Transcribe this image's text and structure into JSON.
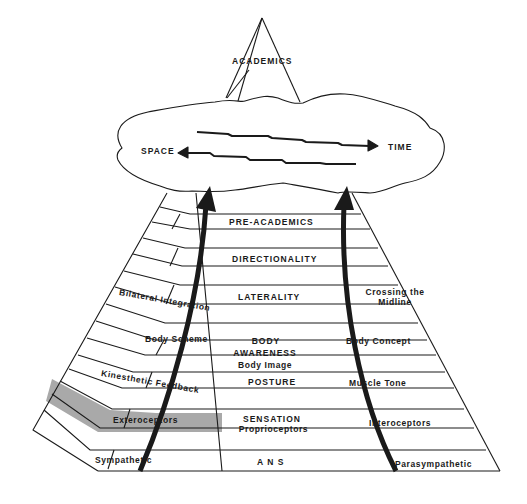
{
  "apex": {
    "label": "ACADEMICS"
  },
  "cloud": {
    "left_label": "SPACE",
    "right_label": "TIME"
  },
  "center_column": [
    {
      "label": "PRE-ACADEMICS"
    },
    {
      "label": "DIRECTIONALITY"
    },
    {
      "label": "LATERALITY"
    },
    {
      "label": "BODY",
      "line2": "AWARENESS",
      "line3": "Body   Image"
    },
    {
      "label": "POSTURE"
    },
    {
      "label": "SENSATION",
      "line2": "Proprioceptors"
    },
    {
      "label": "A N S"
    }
  ],
  "left_column": [
    {
      "label": "Bilateral  Integration"
    },
    {
      "label": "Body  Scheme"
    },
    {
      "label": "Kinesthetic Feedback"
    },
    {
      "label": "Exteroceptors",
      "highlighted": true
    },
    {
      "label": "Sympathetic"
    }
  ],
  "right_column": [
    {
      "label": "Crossing  the",
      "line2": "Midline"
    },
    {
      "label": "Body Concept"
    },
    {
      "label": "Muscle  Tone"
    },
    {
      "label": "Interoceptors"
    },
    {
      "label": "Parasympathetic"
    }
  ],
  "colors": {
    "line": "#1a1a1a",
    "highlight_fill": "#a9a9a9",
    "background": "#ffffff"
  }
}
